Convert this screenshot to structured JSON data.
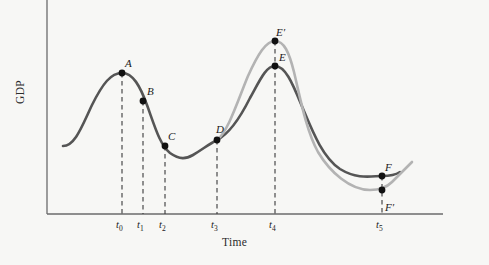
{
  "chart_data": {
    "type": "line",
    "title": "",
    "xlabel": "Time",
    "ylabel": "GDP",
    "grid": false,
    "legend": "none",
    "xlim": [
      0,
      489
    ],
    "ylim": [
      0,
      265
    ],
    "axis": {
      "x_axis_y": 214,
      "y_axis_x": 47,
      "x_axis_end": 443,
      "y_axis_top": 0
    },
    "xticks": [
      {
        "label": "t",
        "sub": "0",
        "x": 122
      },
      {
        "label": "t",
        "sub": "1",
        "x": 143
      },
      {
        "label": "t",
        "sub": "2",
        "x": 165
      },
      {
        "label": "t",
        "sub": "3",
        "x": 217
      },
      {
        "label": "t",
        "sub": "4",
        "x": 275
      },
      {
        "label": "t",
        "sub": "5",
        "x": 382
      }
    ],
    "series": [
      {
        "name": "actual-business-cycle",
        "color": "#555555",
        "style": "solid",
        "width": 2.6,
        "path": "M 63,146 C 75,146 82,126 92,105 C 103,83 111,73 122,73 C 133,73 140,86 147,105 C 155,127 160,145 170,153 C 180,160 186,159 193,155 C 203,149 209,144 217,140 C 229,134 240,118 250,98 C 260,80 266,66 275,66 C 285,66 292,82 301,104 C 312,130 322,157 340,169 C 358,180 372,176 382,176 C 392,176 397,174 400,172"
      },
      {
        "name": "alternative-path",
        "color": "#b3b3b3",
        "style": "solid",
        "width": 2.6,
        "path": "M 217,140 C 228,132 238,100 248,76 C 258,54 266,41 275,41 C 284,41 289,52 294,72 C 300,97 306,130 318,152 C 330,172 350,190 370,190 C 380,190 386,188 392,182 C 400,174 406,168 412,162"
      }
    ],
    "points": [
      {
        "id": "A",
        "label": "A",
        "x": 122,
        "y": 73,
        "label_dx": 3,
        "label_dy": -16,
        "series": "actual-business-cycle"
      },
      {
        "id": "B",
        "label": "B",
        "x": 143,
        "y": 101,
        "label_dx": 4,
        "label_dy": -16,
        "series": "actual-business-cycle"
      },
      {
        "id": "C",
        "label": "C",
        "x": 165,
        "y": 146,
        "label_dx": 3,
        "label_dy": -16,
        "series": "actual-business-cycle"
      },
      {
        "id": "D",
        "label": "D",
        "x": 217,
        "y": 140,
        "label_dx": -1,
        "label_dy": -17,
        "series": "actual-business-cycle"
      },
      {
        "id": "E",
        "label": "E",
        "x": 275,
        "y": 66,
        "label_dx": 4,
        "label_dy": -15,
        "series": "actual-business-cycle"
      },
      {
        "id": "Eprime",
        "label": "E′",
        "x": 275,
        "y": 41,
        "label_dx": 1,
        "label_dy": -15,
        "series": "alternative-path"
      },
      {
        "id": "F",
        "label": "F",
        "x": 382,
        "y": 176,
        "label_dx": 3,
        "label_dy": -15,
        "series": "actual-business-cycle"
      },
      {
        "id": "Fprime",
        "label": "F′",
        "x": 382,
        "y": 190,
        "label_dx": 3,
        "label_dy": 11,
        "series": "alternative-path"
      }
    ],
    "dashed_droplines": [
      {
        "x": 122,
        "y_top": 73,
        "y_bottom": 214
      },
      {
        "x": 143,
        "y_top": 101,
        "y_bottom": 214
      },
      {
        "x": 165,
        "y_top": 146,
        "y_bottom": 214
      },
      {
        "x": 217,
        "y_top": 140,
        "y_bottom": 214
      },
      {
        "x": 275,
        "y_top": 41,
        "y_bottom": 214
      },
      {
        "x": 382,
        "y_top": 176,
        "y_bottom": 214
      }
    ]
  },
  "colors": {
    "background": "#f7f7f5",
    "axis": "#6b6b6b",
    "main_curve": "#555555",
    "alt_curve": "#b3b3b3",
    "marker": "#111111",
    "text": "#1a1a1a"
  }
}
